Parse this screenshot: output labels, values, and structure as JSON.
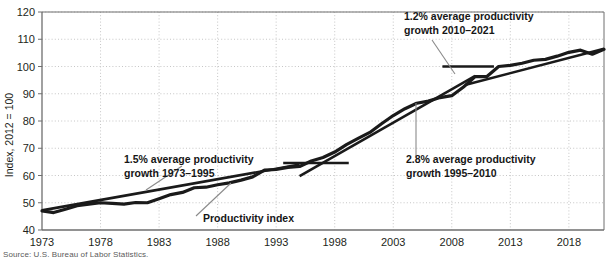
{
  "chart_data": {
    "type": "line",
    "title": "",
    "xlabel": "",
    "ylabel": "Index, 2012 = 100",
    "xlim": [
      1973,
      2021
    ],
    "ylim": [
      40,
      120
    ],
    "grid": true,
    "legend": "none",
    "x_ticks": [
      "1973",
      "1978",
      "1983",
      "1988",
      "1993",
      "1998",
      "2003",
      "2008",
      "2013",
      "2018"
    ],
    "x_tick_values": [
      1973,
      1978,
      1983,
      1988,
      1993,
      1998,
      2003,
      2008,
      2013,
      2018
    ],
    "y_ticks": [
      "40",
      "50",
      "60",
      "70",
      "80",
      "90",
      "100",
      "110",
      "120"
    ],
    "y_tick_values": [
      40,
      50,
      60,
      70,
      80,
      90,
      100,
      110,
      120
    ],
    "series": [
      {
        "name": "Productivity index",
        "x": [
          1973,
          1974,
          1975,
          1976,
          1977,
          1978,
          1979,
          1980,
          1981,
          1982,
          1983,
          1984,
          1985,
          1986,
          1987,
          1988,
          1989,
          1990,
          1991,
          1992,
          1993,
          1994,
          1995,
          1996,
          1997,
          1998,
          1999,
          2000,
          2001,
          2002,
          2003,
          2004,
          2005,
          2006,
          2007,
          2008,
          2009,
          2010,
          2011,
          2012,
          2013,
          2014,
          2015,
          2016,
          2017,
          2018,
          2019,
          2020,
          2021
        ],
        "values": [
          47.0,
          46.4,
          47.6,
          48.9,
          49.5,
          50.0,
          49.8,
          49.5,
          50.1,
          50.0,
          51.5,
          53.0,
          53.8,
          55.5,
          55.7,
          56.6,
          57.3,
          58.3,
          59.5,
          62.0,
          62.2,
          63.0,
          63.3,
          65.3,
          66.6,
          68.6,
          71.3,
          73.6,
          75.8,
          79.0,
          82.0,
          84.5,
          86.5,
          87.3,
          88.6,
          89.3,
          92.5,
          96.3,
          96.3,
          100.0,
          100.4,
          101.2,
          102.3,
          102.6,
          103.8,
          105.2,
          106.0,
          104.5,
          106.3
        ]
      }
    ],
    "trend_lines": [
      {
        "name": "trend-1973-1995",
        "label_rate": "1.5%",
        "x_start": 1973,
        "y_start": 47.2,
        "x_end": 1995,
        "y_end": 64.0
      },
      {
        "name": "trend-1995-2010",
        "label_rate": "2.8%",
        "x_start": 1995,
        "y_start": 59.8,
        "x_end": 2010,
        "y_end": 96.6
      },
      {
        "name": "trend-2010-2021",
        "label_rate": "1.2%",
        "x_start": 2009.2,
        "y_start": 93.3,
        "x_end": 2021,
        "y_end": 106.5
      },
      {
        "name": "flat-marker-1995-1998",
        "x_start": 1993.6,
        "y_start": 64.6,
        "x_end": 1999.2,
        "y_end": 64.6
      },
      {
        "name": "flat-marker-2008-2011",
        "x_start": 2007.2,
        "y_start": 100.0,
        "x_end": 2011.6,
        "y_end": 100.0
      }
    ],
    "annotations": [
      {
        "name": "annotation-1973-1995",
        "line1": "1.5% average productivity",
        "line2": "growth 1973–1995"
      },
      {
        "name": "annotation-1995-2010",
        "line1": "2.8% average productivity",
        "line2": "growth 1995–2010"
      },
      {
        "name": "annotation-2010-2021",
        "line1": "1.2% average productivity",
        "line2": "growth 2010–2021"
      },
      {
        "name": "annotation-series-label",
        "line1": "Productivity index",
        "line2": ""
      }
    ],
    "source": "Source: U.S. Bureau of Labor Statistics.",
    "colors": {
      "line": "#1a1a1a",
      "grid": "#b8b8b8",
      "axis": "#6e6e6e",
      "text": "#231f20",
      "leader": "#8a8a8a",
      "background": "#ffffff"
    }
  }
}
